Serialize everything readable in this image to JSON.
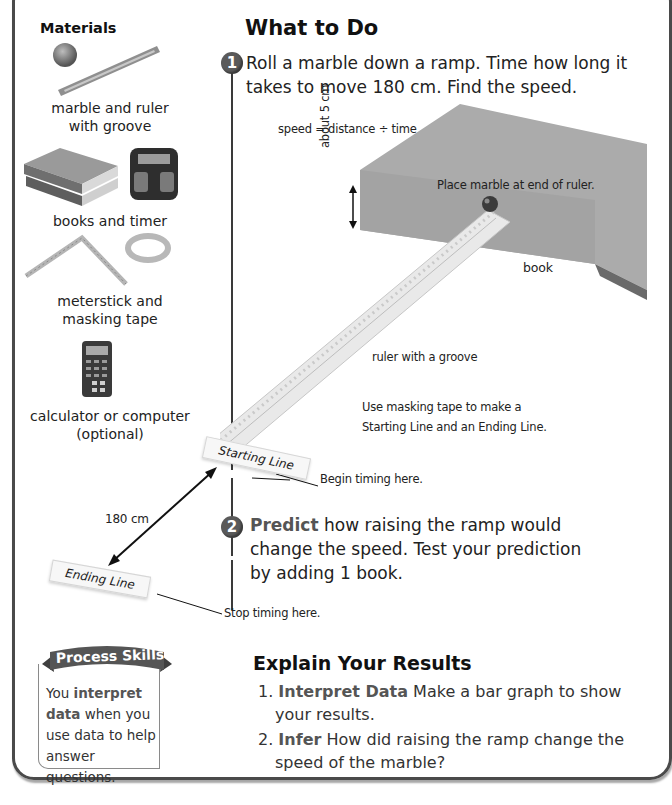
{
  "materials": {
    "title": "Materials",
    "items": [
      {
        "icon": "marble-and-ruler-icon",
        "caption_line1": "marble and ruler",
        "caption_line2": "with groove"
      },
      {
        "icon": "books-and-timer-icon",
        "caption_line1": "books and timer"
      },
      {
        "icon": "meterstick-and-tape-icon",
        "caption_line1": "meterstick and",
        "caption_line2": "masking tape"
      },
      {
        "icon": "calculator-icon",
        "caption_line1": "calculator or computer",
        "caption_line2": "(optional)"
      }
    ]
  },
  "what_to_do": {
    "title": "What to Do",
    "steps": [
      {
        "number": "1",
        "line1": "Roll a marble down a ramp. Time how long it",
        "line2": "takes to move 180 cm. Find the speed."
      },
      {
        "number": "2",
        "bold": "Predict",
        "line1_rest": " how raising the ramp would",
        "line2": "change the speed. Test your prediction",
        "line3": "by adding 1 book."
      }
    ]
  },
  "diagram": {
    "formula": "speed = distance ÷ time",
    "height_label": "about 5 cm",
    "marble_label": "Place marble at end of ruler.",
    "book_label": "book",
    "ruler_label": "ruler with a groove",
    "tape_note_line1": "Use masking tape to make a",
    "tape_note_line2": "Starting Line and an Ending Line.",
    "starting_line": "Starting Line",
    "begin_label": "Begin timing here.",
    "distance_label": "180 cm",
    "ending_line": "Ending Line",
    "stop_label": "Stop timing here."
  },
  "process_skills": {
    "title": "Process Skills",
    "text_pre": "You ",
    "bold": "interpret data",
    "text_post": " when you use data to help answer questions."
  },
  "explain_results": {
    "title": "Explain Your Results",
    "items": [
      {
        "num": "1.",
        "bold": "Interpret Data",
        "rest_line1": " Make a bar graph to show",
        "line2": "your results."
      },
      {
        "num": "2.",
        "bold": "Infer",
        "rest_line1": " How did raising the ramp change the",
        "line2": "speed of the marble?"
      }
    ]
  },
  "colors": {
    "frame": "#4a4a4a",
    "accent_grey": "#555555",
    "book": "#a9a9a9"
  }
}
